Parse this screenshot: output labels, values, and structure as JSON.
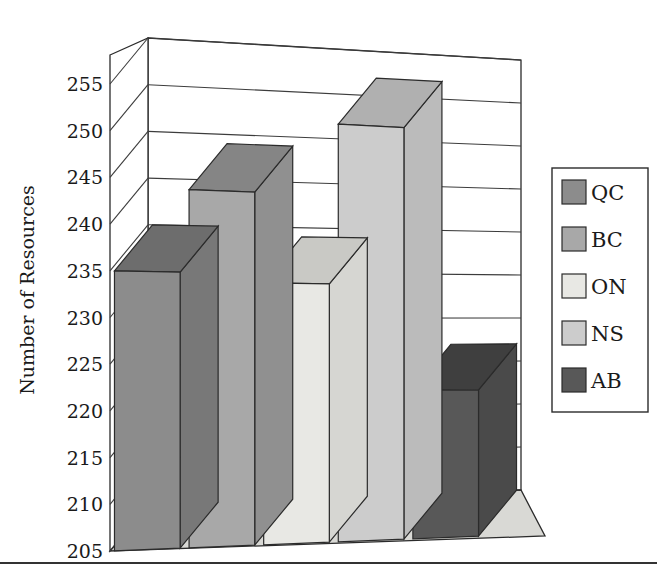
{
  "chart_data": {
    "type": "bar",
    "title": "",
    "subtitle": "",
    "xlabel": "",
    "ylabel": "Number of Resources",
    "categories": [
      "QC",
      "BC",
      "ON",
      "NS",
      "AB"
    ],
    "values": [
      235,
      244,
      234,
      252,
      222
    ],
    "series": [
      {
        "name": "Number of Resources",
        "values": [
          235,
          244,
          234,
          252,
          222
        ]
      }
    ],
    "ylim": [
      205,
      255
    ],
    "ytick_labels": [
      "255",
      "250",
      "245",
      "240",
      "235",
      "230",
      "225",
      "220",
      "215",
      "210",
      "205"
    ],
    "yticks": [
      255,
      250,
      245,
      240,
      235,
      230,
      225,
      220,
      215,
      210,
      205
    ],
    "ytick_step": 5,
    "grid": true,
    "grid_axis": "y",
    "legend_position": "right",
    "projection": "3d",
    "legend": [
      {
        "label": "QC",
        "color": "#8c8c8c"
      },
      {
        "label": "BC",
        "color": "#a8a8a8"
      },
      {
        "label": "ON",
        "color": "#e8e8e4"
      },
      {
        "label": "NS",
        "color": "#cccccc"
      },
      {
        "label": "AB",
        "color": "#585858"
      }
    ],
    "bar_colors": {
      "QC": {
        "front": "#8c8c8c",
        "top": "#6d6d6d",
        "side": "#787878"
      },
      "BC": {
        "front": "#a8a8a8",
        "top": "#858585",
        "side": "#909090"
      },
      "ON": {
        "front": "#e8e8e4",
        "top": "#c9c9c5",
        "side": "#d6d6d2"
      },
      "NS": {
        "front": "#cccccc",
        "top": "#b0b0b0",
        "side": "#bbbbbb"
      },
      "AB": {
        "front": "#585858",
        "top": "#3f3f3f",
        "side": "#4a4a4a"
      }
    },
    "floor_color": "#d9d9d5",
    "wall_color": "#ffffff",
    "axis_color": "#2b2b2b"
  },
  "figure": {
    "bottom_rule_color": "#333333"
  }
}
